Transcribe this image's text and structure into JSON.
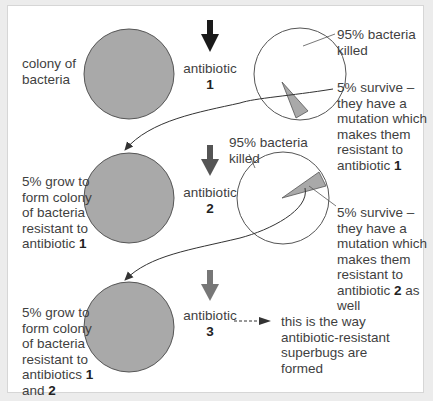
{
  "stage1": {
    "colony_label": "colony of\nbacteria",
    "antibiotic_label": "antibiotic",
    "antibiotic_number": "1",
    "killed_label": "95% bacteria\nkilled",
    "survive_label_a": "5% survive –\nthey have a\nmutation which\nmakes them\nresistant to\nantibiotic ",
    "survive_label_num": "1",
    "arrow_color": "#1a1a1a"
  },
  "stage2": {
    "colony_label_a": "5% grow to\nform colony\nof bacteria\nresistant to\nantibiotic ",
    "colony_label_num": "1",
    "antibiotic_label": "antibiotic",
    "antibiotic_number": "2",
    "killed_label": "95% bacteria\nkilled",
    "survive_label_a": "5% survive –\nthey have a\nmutation which\nmakes them\nresistant to\nantibiotic ",
    "survive_label_num": "2",
    "survive_label_b": " as\nwell",
    "arrow_color": "#555555"
  },
  "stage3": {
    "colony_label_a": "5% grow to\nform colony\nof bacteria\nresistant to\nantibiotics ",
    "colony_label_num1": "1",
    "colony_label_mid": "\nand ",
    "colony_label_num2": "2",
    "antibiotic_label": "antibiotic",
    "antibiotic_number": "3",
    "arrow_color": "#777777",
    "conclusion_label": "this is the way\nantibiotic-resistant\nsuperbugs are\nformed"
  },
  "colors": {
    "colony_fill": "#a9a9a9",
    "survivor_fill": "#a9a9a9",
    "outline": "#555555",
    "frame_bg": "#ececec",
    "panel_bg": "#ffffff"
  },
  "pie": {
    "killed_percent": 95,
    "survive_percent": 5
  }
}
